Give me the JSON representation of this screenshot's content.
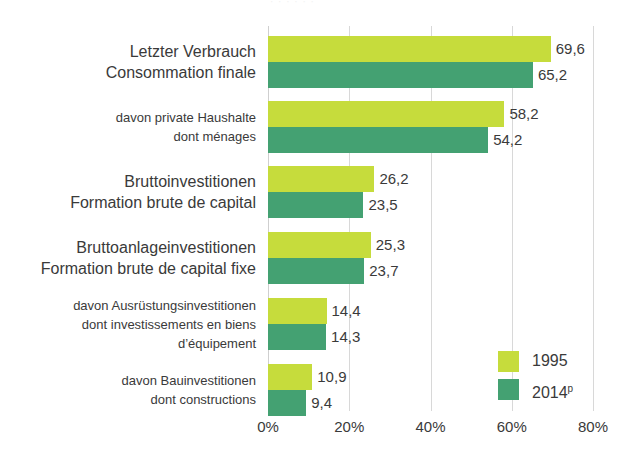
{
  "title_sliver": "· · · · · ·",
  "chart_data": {
    "type": "bar",
    "orientation": "horizontal",
    "title": "",
    "xlabel": "",
    "ylabel": "",
    "xlim": [
      0,
      80
    ],
    "xticks": [
      0,
      20,
      40,
      60,
      80
    ],
    "xtick_labels": [
      "0%",
      "20%",
      "40%",
      "60%",
      "80%"
    ],
    "grid": true,
    "legend_position": "lower-right",
    "value_decimal_separator": ",",
    "categories": [
      {
        "de": "Letzter Verbrauch",
        "fr": "Consommation finale",
        "emphasis": "big"
      },
      {
        "de": "davon private Haushalte",
        "fr": "dont ménages",
        "emphasis": "small"
      },
      {
        "de": "Bruttoinvestitionen",
        "fr": "Formation brute de capital",
        "emphasis": "big"
      },
      {
        "de": "Bruttoanlageinvestitionen",
        "fr": "Formation brute de capital fixe",
        "emphasis": "big"
      },
      {
        "de": "davon Ausrüstungsinvestitionen",
        "fr": "dont investissements en biens",
        "fr2": "d’équipement",
        "emphasis": "small"
      },
      {
        "de": "davon Bauinvestitionen",
        "fr": "dont constructions",
        "emphasis": "small"
      }
    ],
    "series": [
      {
        "name": "1995",
        "color": "#c6dc3c",
        "values": [
          69.6,
          58.2,
          26.2,
          25.3,
          14.4,
          10.9
        ],
        "labels": [
          "69,6",
          "58,2",
          "26,2",
          "25,3",
          "14,4",
          "10,9"
        ]
      },
      {
        "name": "2014",
        "name_suffix": "p",
        "color": "#44a172",
        "values": [
          65.2,
          54.2,
          23.5,
          23.7,
          14.3,
          9.4
        ],
        "labels": [
          "65,2",
          "54,2",
          "23,5",
          "23,7",
          "14,3",
          "9,4"
        ]
      }
    ]
  },
  "legend": {
    "items": [
      {
        "label": "1995",
        "suffix": "",
        "color": "#c6dc3c"
      },
      {
        "label": "2014",
        "suffix": "p",
        "color": "#44a172"
      }
    ]
  },
  "colors": {
    "series_1995": "#c6dc3c",
    "series_2014": "#44a172",
    "gridline": "#d8d8d8",
    "text": "#3a3a3a",
    "background": "#ffffff"
  }
}
